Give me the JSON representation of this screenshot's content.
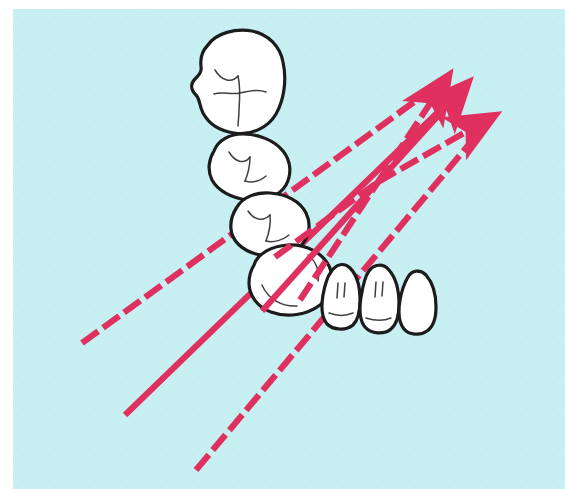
{
  "figure": {
    "alt_text": "Line drawing of a mandibular quadrant: four posterior teeth (molars and premolar/canine) arranged in a curved arch with three incisor-shaped anterior teeth, overlaid by three crimson arrows that converge at a point distal to the canine and point up-and-right.",
    "caption": "",
    "background_color": "#c8f0f2",
    "paper_color": "#ffffff",
    "ink_color": "#1a1a1a",
    "arrow_color": "#e03060",
    "arrow_color_dark": "#c02050",
    "canvas": {
      "width": 565,
      "height": 489
    },
    "background_rect": {
      "x": 13,
      "y": 9,
      "width": 552,
      "height": 480
    }
  },
  "teeth": [
    {
      "id": "tooth-1",
      "label": "first molar",
      "type": "molar",
      "position": "posterior-upper",
      "outline": "M 208 45 C 216 33, 236 28, 252 31 C 268 34, 280 46, 283 62 C 287 80, 284 100, 276 114 C 268 128, 250 136, 234 133 C 220 131, 209 124, 203 113 C 199 105, 200 99, 196 95 C 191 90, 190 84, 195 79 C 199 75, 202 72, 201 66 C 200 57, 203 50, 208 45 Z",
      "fissures": [
        "M 215 70 C 221 80, 231 84, 238 76",
        "M 238 76 C 240 84, 240 96, 239 110 C 239 117, 238 122, 238 126",
        "M 214 94 C 222 91, 232 95, 240 93 C 250 91, 258 89, 266 92"
      ]
    },
    {
      "id": "tooth-2",
      "label": "second molar",
      "type": "molar",
      "position": "posterior",
      "outline": "M 214 151 C 218 140, 230 134, 243 134 C 258 134, 274 140, 283 151 C 291 161, 292 174, 286 185 C 279 197, 263 202, 247 200 C 232 198, 218 191, 212 180 C 207 170, 209 159, 214 151 Z",
      "fissures": [
        "M 229 152 C 235 162, 244 165, 250 157",
        "M 250 157 C 250 166, 248 174, 245 181",
        "M 245 181 C 252 183, 260 181, 266 176"
      ]
    },
    {
      "id": "tooth-3",
      "label": "second premolar",
      "type": "premolar",
      "position": "posterior",
      "outline": "M 237 207 C 243 197, 256 192, 270 193 C 286 194, 300 201, 306 213 C 312 225, 309 239, 299 247 C 288 256, 271 258, 256 254 C 242 250, 232 241, 231 229 C 230 220, 233 213, 237 207 Z",
      "fissures": [
        "M 248 211 C 254 220, 263 222, 270 215",
        "M 270 215 C 271 224, 269 233, 266 241",
        "M 266 241 C 274 243, 283 240, 289 235"
      ]
    },
    {
      "id": "tooth-4",
      "label": "first premolar / canine",
      "type": "premolar",
      "position": "posterior",
      "outline": "M 254 265 C 258 253, 272 246, 288 245 C 305 244, 322 252, 329 266 C 336 280, 332 296, 320 305 C 307 315, 287 318, 271 312 C 257 307, 249 295, 249 283 C 249 276, 251 270, 254 265 Z",
      "fissures": [
        "M 308 255 C 316 261, 320 272, 318 281",
        "M 262 285 C 268 299, 282 307, 297 306"
      ]
    },
    {
      "id": "tooth-5",
      "label": "anterior tooth 1 (canine)",
      "type": "incisor",
      "position": "anterior",
      "outline": "M 331 272 C 336 264, 344 262, 350 268 C 357 275, 360 288, 360 300 C 360 311, 358 320, 353 325 C 346 331, 333 330, 327 324 C 322 318, 321 307, 323 295 C 325 284, 327 277, 331 272 Z",
      "fissures": [
        "M 338 283 L 337 298",
        "M 345 283 L 344 297",
        "M 329 313 C 337 316, 346 316, 353 313"
      ]
    },
    {
      "id": "tooth-6",
      "label": "anterior tooth 2 (lateral incisor)",
      "type": "incisor",
      "position": "anterior",
      "outline": "M 369 271 C 374 264, 383 263, 389 270 C 396 278, 399 291, 399 304 C 399 315, 397 324, 391 329 C 384 335, 371 334, 365 327 C 360 321, 359 310, 361 297 C 363 285, 365 276, 369 271 Z",
      "fissures": [
        "M 376 282 L 375 297",
        "M 383 282 L 382 296",
        "M 366 318 C 375 321, 384 321, 391 318"
      ]
    },
    {
      "id": "tooth-7",
      "label": "anterior tooth 3 (central incisor)",
      "type": "incisor",
      "position": "anterior",
      "outline": "M 408 277 C 412 270, 420 269, 426 275 C 433 283, 436 295, 436 307 C 436 318, 433 327, 427 331 C 420 336, 409 335, 404 329 C 399 323, 398 312, 400 300 C 402 289, 405 282, 408 277 Z",
      "fissures": []
    }
  ],
  "arrows": [
    {
      "id": "arrow-upper",
      "label": "upper force vector",
      "style": "dashed",
      "color": "#e03060",
      "from": {
        "x": 82,
        "y": 343
      },
      "to": {
        "x": 447,
        "y": 78
      },
      "through": {
        "x": 378,
        "y": 182
      },
      "has_arrowhead": true,
      "dash_pattern": "20 6"
    },
    {
      "id": "arrow-middle",
      "label": "middle force vector",
      "style": "solid",
      "color": "#e03060",
      "from": {
        "x": 125,
        "y": 415
      },
      "to": {
        "x": 466,
        "y": 85
      },
      "through": {
        "x": 378,
        "y": 182
      },
      "has_arrowhead": true,
      "dash_pattern": "none"
    },
    {
      "id": "arrow-lower",
      "label": "lower force vector",
      "style": "dashed",
      "color": "#e03060",
      "from": {
        "x": 196,
        "y": 470
      },
      "to": {
        "x": 492,
        "y": 117
      },
      "through": {
        "x": 378,
        "y": 182
      },
      "has_arrowhead": true,
      "dash_pattern": "20 6"
    }
  ],
  "convergence_point": {
    "x": 378,
    "y": 182,
    "label": "arrow convergence point"
  }
}
